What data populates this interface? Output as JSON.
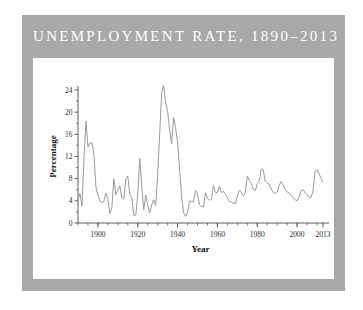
{
  "figure": {
    "title": "UNEMPLOYMENT RATE, 1890–2013",
    "frame_color": "#a8a8a8",
    "panel_color": "#ffffff",
    "title_color": "#ffffff"
  },
  "chart_data": {
    "type": "line",
    "title": "UNEMPLOYMENT RATE, 1890–2013",
    "xlabel": "Year",
    "ylabel": "Percentage",
    "xlim": [
      1890,
      2013
    ],
    "ylim": [
      0,
      24
    ],
    "grid": false,
    "legend": null,
    "line_color": "#9a9a9a",
    "x_major_ticks": [
      1900,
      1920,
      1940,
      1960,
      1980,
      2000,
      2013
    ],
    "x_major_tick_labels": [
      "1900",
      "1920",
      "1940",
      "1960",
      "1980",
      "2000",
      "2013"
    ],
    "x_minor_tick_step": 5,
    "y_ticks": [
      0,
      4,
      8,
      12,
      16,
      20,
      24
    ],
    "y_tick_labels": [
      "0",
      "4",
      "8",
      "12",
      "16",
      "20",
      "24"
    ],
    "x": [
      1890,
      1891,
      1892,
      1893,
      1894,
      1895,
      1896,
      1897,
      1898,
      1899,
      1900,
      1901,
      1902,
      1903,
      1904,
      1905,
      1906,
      1907,
      1908,
      1909,
      1910,
      1911,
      1912,
      1913,
      1914,
      1915,
      1916,
      1917,
      1918,
      1919,
      1920,
      1921,
      1922,
      1923,
      1924,
      1925,
      1926,
      1927,
      1928,
      1929,
      1930,
      1931,
      1932,
      1933,
      1934,
      1935,
      1936,
      1937,
      1938,
      1939,
      1940,
      1941,
      1942,
      1943,
      1944,
      1945,
      1946,
      1947,
      1948,
      1949,
      1950,
      1951,
      1952,
      1953,
      1954,
      1955,
      1956,
      1957,
      1958,
      1959,
      1960,
      1961,
      1962,
      1963,
      1964,
      1965,
      1966,
      1967,
      1968,
      1969,
      1970,
      1971,
      1972,
      1973,
      1974,
      1975,
      1976,
      1977,
      1978,
      1979,
      1980,
      1981,
      1982,
      1983,
      1984,
      1985,
      1986,
      1987,
      1988,
      1989,
      1990,
      1991,
      1992,
      1993,
      1994,
      1995,
      1996,
      1997,
      1998,
      1999,
      2000,
      2001,
      2002,
      2003,
      2004,
      2005,
      2006,
      2007,
      2008,
      2009,
      2010,
      2011,
      2012,
      2013
    ],
    "values": [
      4.0,
      5.4,
      3.0,
      11.7,
      18.4,
      13.7,
      14.4,
      14.5,
      12.4,
      6.5,
      5.0,
      4.0,
      3.7,
      3.9,
      5.4,
      4.3,
      1.7,
      2.8,
      8.0,
      5.1,
      5.9,
      6.7,
      4.6,
      4.3,
      7.9,
      8.5,
      5.1,
      4.6,
      1.4,
      1.4,
      5.2,
      11.7,
      6.7,
      2.4,
      5.0,
      3.2,
      1.8,
      3.3,
      4.2,
      3.2,
      8.7,
      15.9,
      23.6,
      24.9,
      21.7,
      20.1,
      16.9,
      14.3,
      19.0,
      17.2,
      14.6,
      9.9,
      4.7,
      1.9,
      1.2,
      1.9,
      3.9,
      3.9,
      3.8,
      5.9,
      5.3,
      3.3,
      3.0,
      2.9,
      5.5,
      4.4,
      4.1,
      4.3,
      6.8,
      5.5,
      5.5,
      6.7,
      5.5,
      5.7,
      5.2,
      4.5,
      3.8,
      3.8,
      3.6,
      3.5,
      4.9,
      5.9,
      5.6,
      4.9,
      5.6,
      8.5,
      7.7,
      7.1,
      6.1,
      5.8,
      7.1,
      7.6,
      9.7,
      9.6,
      7.5,
      7.2,
      7.0,
      6.2,
      5.5,
      5.3,
      5.6,
      6.8,
      7.5,
      6.9,
      6.1,
      5.6,
      5.4,
      4.9,
      4.5,
      4.2,
      4.0,
      4.7,
      5.8,
      6.0,
      5.5,
      5.1,
      4.6,
      4.6,
      5.8,
      9.3,
      9.6,
      8.9,
      8.1,
      7.4
    ]
  }
}
